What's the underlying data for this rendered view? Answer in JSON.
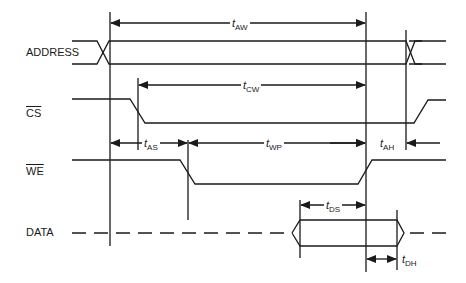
{
  "diagram": {
    "type": "timing-diagram",
    "signals": [
      {
        "id": "address",
        "label": "ADDRESS",
        "overbar": false
      },
      {
        "id": "cs",
        "label": "CS",
        "overbar": true
      },
      {
        "id": "we",
        "label": "WE",
        "overbar": true
      },
      {
        "id": "data",
        "label": "DATA",
        "overbar": false
      }
    ],
    "timings": [
      {
        "id": "tAW",
        "t": "t",
        "sub": "AW"
      },
      {
        "id": "tCW",
        "t": "t",
        "sub": "CW"
      },
      {
        "id": "tAS",
        "t": "t",
        "sub": "AS"
      },
      {
        "id": "tWP",
        "t": "t",
        "sub": "WP"
      },
      {
        "id": "tAH",
        "t": "t",
        "sub": "AH"
      },
      {
        "id": "tDS",
        "t": "t",
        "sub": "DS"
      },
      {
        "id": "tDH",
        "t": "t",
        "sub": "DH"
      }
    ],
    "line_color": "#1a1a1a"
  }
}
